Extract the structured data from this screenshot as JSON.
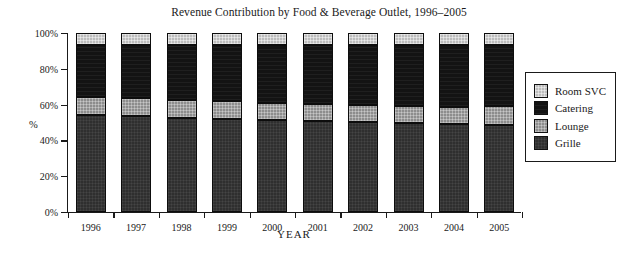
{
  "chart_data": {
    "type": "bar",
    "title": "Revenue Contribution by Food & Beverage Outlet, 1996–2005",
    "xlabel": "YEAR",
    "ylabel": "%",
    "stacked": true,
    "stack_order_bottom_to_top": [
      "Grille",
      "Lounge",
      "Catering",
      "Room SVC"
    ],
    "grid": false,
    "legend_position": "right",
    "ylim": [
      0,
      100
    ],
    "ytick_labels": [
      "0%",
      "20%",
      "40%",
      "60%",
      "80%",
      "100%"
    ],
    "ytick_values": [
      0,
      20,
      40,
      60,
      80,
      100
    ],
    "categories": [
      "1996",
      "1997",
      "1998",
      "1999",
      "2000",
      "2001",
      "2002",
      "2003",
      "2004",
      "2005"
    ],
    "series": [
      {
        "name": "Grille",
        "color": "#2f2f2f",
        "values": [
          54.0,
          53.5,
          52.5,
          52.0,
          51.5,
          50.8,
          50.3,
          49.7,
          49.2,
          48.6
        ]
      },
      {
        "name": "Lounge",
        "color": "#8d8d8d",
        "values": [
          10.0,
          10.1,
          10.1,
          10.1,
          9.5,
          9.5,
          9.5,
          9.5,
          9.5,
          10.6
        ]
      },
      {
        "name": "Catering",
        "color": "#131313",
        "values": [
          29.3,
          29.7,
          30.7,
          31.2,
          32.3,
          33.0,
          33.5,
          34.1,
          34.6,
          34.2
        ]
      },
      {
        "name": "Room SVC",
        "color": "#bdbdbd",
        "values": [
          6.7,
          6.7,
          6.7,
          6.7,
          6.7,
          6.7,
          6.7,
          6.7,
          6.7,
          6.6
        ]
      }
    ]
  },
  "legend": {
    "items": [
      {
        "label": "Room SVC",
        "color": "#bdbdbd",
        "swatch": "roomsvc"
      },
      {
        "label": "Catering",
        "color": "#131313",
        "swatch": "catering"
      },
      {
        "label": "Lounge",
        "color": "#8d8d8d",
        "swatch": "lounge"
      },
      {
        "label": "Grille",
        "color": "#2f2f2f",
        "swatch": "grille"
      }
    ]
  }
}
